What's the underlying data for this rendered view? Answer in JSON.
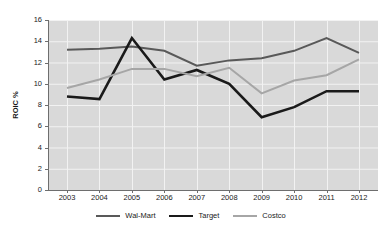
{
  "chart_data": {
    "type": "line",
    "title": "",
    "xlabel": "",
    "ylabel": "ROIC %",
    "categories": [
      "2003",
      "2004",
      "2005",
      "2006",
      "2007",
      "2008",
      "2009",
      "2010",
      "2011",
      "2012"
    ],
    "x": [
      2003,
      2004,
      2005,
      2006,
      2007,
      2008,
      2009,
      2010,
      2011,
      2012
    ],
    "ylim": [
      0,
      16
    ],
    "yticks": [
      0,
      2,
      4,
      6,
      8,
      10,
      12,
      14,
      16
    ],
    "ytick_labels": [
      "0",
      "2",
      "4",
      "6",
      "8",
      "10",
      "12",
      "14",
      "16"
    ],
    "grid": true,
    "legend_position": "bottom",
    "plot_background": "#d9d9d9",
    "gridline_color": "#f2f2f2",
    "series": [
      {
        "name": "Wal-Mart",
        "color": "#595959",
        "width": 2.0,
        "values": [
          13.2,
          13.3,
          13.5,
          13.1,
          11.7,
          12.2,
          12.4,
          13.1,
          14.3,
          12.9
        ]
      },
      {
        "name": "Target",
        "color": "#1a1a1a",
        "width": 2.6,
        "values": [
          8.8,
          8.55,
          14.3,
          10.4,
          11.3,
          10.0,
          6.85,
          7.8,
          9.3,
          9.3
        ]
      },
      {
        "name": "Costco",
        "color": "#a6a6a6",
        "width": 2.0,
        "values": [
          9.6,
          10.4,
          11.4,
          11.4,
          10.7,
          11.5,
          9.1,
          10.3,
          10.8,
          12.3
        ]
      }
    ]
  },
  "legend": {
    "items": [
      {
        "label": "Wal-Mart",
        "color": "#595959",
        "width": 2.0
      },
      {
        "label": "Target",
        "color": "#1a1a1a",
        "width": 2.6
      },
      {
        "label": "Costco",
        "color": "#a6a6a6",
        "width": 2.0
      }
    ]
  }
}
